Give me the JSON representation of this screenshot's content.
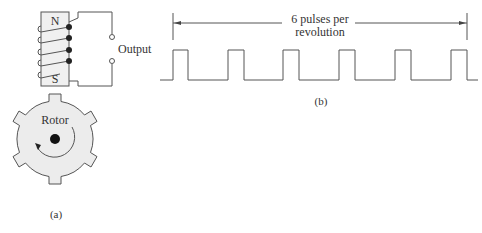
{
  "figure_a": {
    "magnet": {
      "north_label": "N",
      "south_label": "S"
    },
    "output_label": "Output",
    "rotor_label": "Rotor",
    "rotor_teeth": 6,
    "caption": "(a)"
  },
  "figure_b": {
    "annotation_line1": "6 pulses per",
    "annotation_line2": "revolution",
    "pulse_count": 6,
    "caption": "(b)"
  },
  "colors": {
    "stroke": "#555555",
    "rotor_fill": "#ececec",
    "magnet_fill": "#f0f0f0",
    "dot": "#222222"
  }
}
